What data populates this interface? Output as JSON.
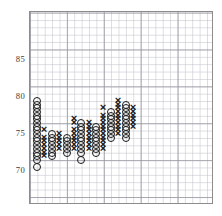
{
  "chart": {
    "title": "",
    "type_label": "point-and-figure",
    "axis": {
      "y_ticks": [
        "85",
        "80",
        "75",
        "70"
      ],
      "y_tick_values": [
        85,
        80,
        75,
        70
      ],
      "x_ticks": [],
      "grid": "on",
      "minor_grid": "on"
    },
    "symbols": {
      "rising": "X",
      "falling": "O"
    }
  },
  "chart_data": {
    "type": "scatter",
    "title": "",
    "xlabel": "",
    "ylabel": "",
    "ylim": [
      66.5,
      92.5
    ],
    "xlim": [
      0,
      25
    ],
    "grid": true,
    "legend": null,
    "box_size": 0.5,
    "y_ticks": [
      70,
      75,
      80,
      85
    ],
    "columns": [
      {
        "index": 1,
        "symbol": "O",
        "values": [
          79.5,
          79.0,
          78.5,
          78.0,
          77.5,
          77.0,
          76.5,
          76.0,
          75.5,
          75.0,
          74.5,
          74.0,
          73.5,
          73.0,
          72.5,
          72.0,
          71.5,
          70.5
        ]
      },
      {
        "index": 2,
        "symbol": "X",
        "values": [
          72.0,
          72.5,
          73.0,
          73.5,
          74.0,
          74.5,
          75.5
        ]
      },
      {
        "index": 3,
        "symbol": "O",
        "values": [
          75.0,
          74.5,
          74.0,
          73.5,
          73.0,
          72.5,
          72.0
        ]
      },
      {
        "index": 4,
        "symbol": "X",
        "values": [
          73.0,
          73.5,
          74.0,
          74.5,
          75.0
        ]
      },
      {
        "index": 5,
        "symbol": "O",
        "values": [
          74.5,
          74.0,
          73.5,
          73.0,
          72.5
        ]
      },
      {
        "index": 6,
        "symbol": "X",
        "values": [
          73.0,
          73.5,
          74.0,
          74.5,
          75.0,
          75.5,
          76.5,
          77.0
        ]
      },
      {
        "index": 7,
        "symbol": "O",
        "values": [
          76.5,
          76.0,
          75.5,
          75.0,
          74.5,
          74.0,
          73.5,
          73.0,
          72.5,
          71.5
        ]
      },
      {
        "index": 8,
        "symbol": "X",
        "values": [
          73.0,
          73.5,
          74.0,
          74.5,
          75.0,
          75.5,
          76.0,
          76.5
        ]
      },
      {
        "index": 9,
        "symbol": "O",
        "values": [
          76.0,
          75.5,
          75.0,
          74.5,
          74.0,
          73.5,
          73.0,
          72.5
        ]
      },
      {
        "index": 10,
        "symbol": "X",
        "values": [
          73.0,
          73.5,
          74.0,
          74.5,
          75.0,
          75.5,
          76.0,
          76.5,
          77.0,
          77.5,
          78.5
        ]
      },
      {
        "index": 11,
        "symbol": "O",
        "values": [
          78.0,
          77.5,
          77.0,
          76.5,
          76.0,
          75.5,
          75.0,
          74.5
        ]
      },
      {
        "index": 12,
        "symbol": "X",
        "values": [
          75.0,
          75.5,
          76.0,
          76.5,
          77.0,
          77.5,
          78.0,
          78.5,
          79.0,
          79.5
        ]
      },
      {
        "index": 13,
        "symbol": "O",
        "values": [
          79.0,
          78.5,
          78.0,
          77.5,
          77.0,
          76.5,
          76.0,
          75.5,
          75.0,
          74.5
        ]
      },
      {
        "index": 14,
        "symbol": "X",
        "values": [
          76.0,
          76.5,
          77.0,
          77.5,
          78.0,
          78.5
        ]
      }
    ]
  },
  "render": {
    "plot": {
      "left": 29,
      "top": 11,
      "width": 184,
      "height": 193
    },
    "cell": 7.38,
    "value_at_70_y": 170,
    "px_per_unit": 7.38
  }
}
